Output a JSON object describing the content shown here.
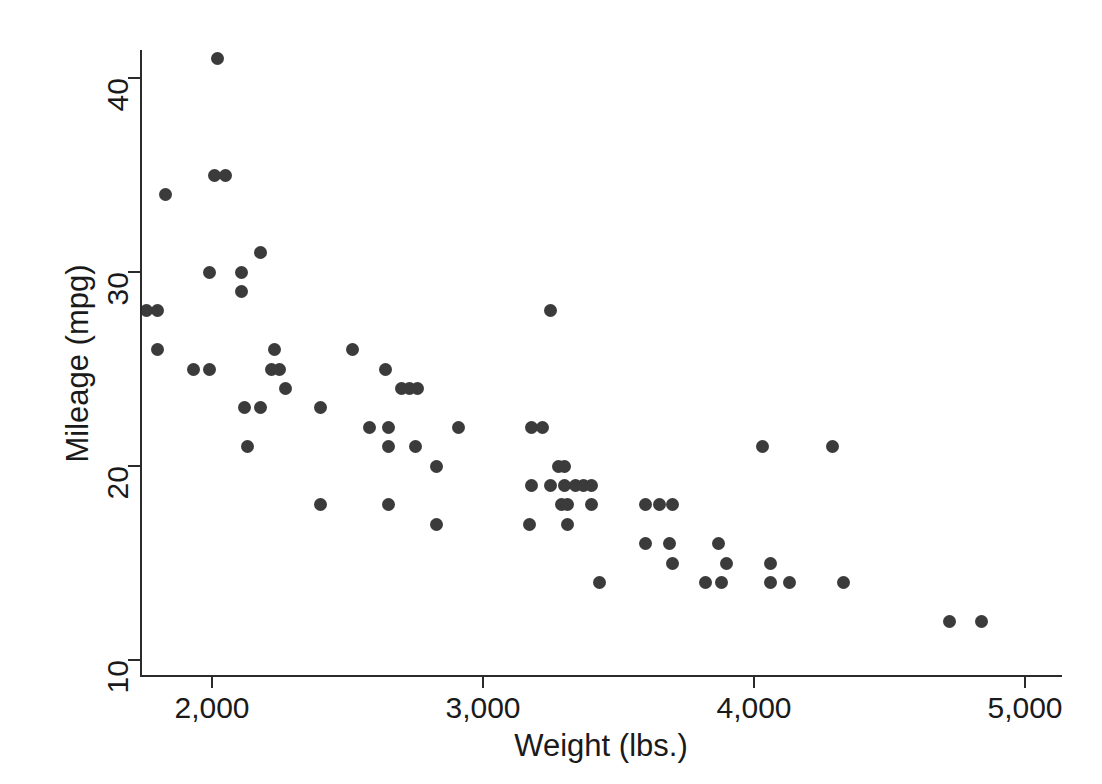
{
  "chart_data": {
    "type": "scatter",
    "title": "",
    "xlabel": "Weight (lbs.)",
    "ylabel": "Mileage (mpg)",
    "xlim": [
      1700,
      5050
    ],
    "ylim": [
      9.2,
      42.0
    ],
    "grid": false,
    "legend": "none",
    "marker": {
      "shape": "circle",
      "color": "#3b3b3b",
      "size_px": 13
    },
    "xticks": [
      2000,
      3000,
      4000,
      5000
    ],
    "xtick_labels": [
      "2,000",
      "3,000",
      "4,000",
      "5,000"
    ],
    "yticks": [
      10,
      20,
      30,
      40
    ],
    "ytick_labels": [
      "10",
      "20",
      "30",
      "40"
    ],
    "n_points": 74,
    "x": [
      1760,
      1800,
      1830,
      1800,
      2020,
      2020,
      2050,
      2040,
      1930,
      1990,
      2110,
      2160,
      2230,
      2110,
      2240,
      2230,
      2200,
      2230,
      2240,
      2070,
      2130,
      2240,
      2290,
      2370,
      2400,
      2520,
      2580,
      2650,
      2640,
      2670,
      2690,
      2700,
      2670,
      2650,
      2640,
      2750,
      2730,
      2800,
      2830,
      2830,
      2910,
      3180,
      3210,
      3250,
      3220,
      3280,
      3250,
      3260,
      3170,
      3170,
      3300,
      3330,
      3350,
      3370,
      3400,
      3380,
      3430,
      3420,
      3440,
      3470,
      3600,
      3600,
      3690,
      3700,
      3690,
      3720,
      3820,
      3850,
      3880,
      3900,
      4030,
      4060,
      4060,
      4080,
      4130,
      4290,
      4330,
      4720,
      4840
    ],
    "y": [
      28,
      28,
      34,
      26,
      41,
      35,
      35,
      30,
      25,
      25,
      30,
      31,
      26,
      29,
      25,
      25,
      23,
      24,
      24,
      21,
      23,
      25,
      24,
      23,
      18,
      26,
      22,
      22,
      25,
      24,
      24,
      24,
      21,
      21,
      18,
      22,
      21,
      20,
      17,
      17,
      22,
      17,
      22,
      28,
      22,
      20,
      20,
      19,
      19,
      19,
      19,
      18,
      19,
      19,
      19,
      18,
      14,
      17,
      18,
      18,
      18,
      16,
      18,
      18,
      16,
      15,
      18,
      14,
      14,
      16,
      21,
      15,
      14,
      14,
      14,
      21,
      14,
      12,
      12
    ],
    "points": [
      {
        "weight": 1760,
        "mpg": 28
      },
      {
        "weight": 1800,
        "mpg": 28
      },
      {
        "weight": 1830,
        "mpg": 34
      },
      {
        "weight": 1800,
        "mpg": 26
      },
      {
        "weight": 2020,
        "mpg": 41
      },
      {
        "weight": 2010,
        "mpg": 35
      },
      {
        "weight": 2050,
        "mpg": 35
      },
      {
        "weight": 1990,
        "mpg": 30
      },
      {
        "weight": 1930,
        "mpg": 25
      },
      {
        "weight": 1990,
        "mpg": 25
      },
      {
        "weight": 2110,
        "mpg": 30
      },
      {
        "weight": 2180,
        "mpg": 31
      },
      {
        "weight": 2230,
        "mpg": 26
      },
      {
        "weight": 2110,
        "mpg": 29
      },
      {
        "weight": 2220,
        "mpg": 25
      },
      {
        "weight": 2250,
        "mpg": 25
      },
      {
        "weight": 2120,
        "mpg": 23
      },
      {
        "weight": 2180,
        "mpg": 23
      },
      {
        "weight": 2270,
        "mpg": 24
      },
      {
        "weight": 2130,
        "mpg": 21
      },
      {
        "weight": 2400,
        "mpg": 23
      },
      {
        "weight": 2400,
        "mpg": 18
      },
      {
        "weight": 2520,
        "mpg": 26
      },
      {
        "weight": 2640,
        "mpg": 25
      },
      {
        "weight": 2580,
        "mpg": 22
      },
      {
        "weight": 2650,
        "mpg": 22
      },
      {
        "weight": 2700,
        "mpg": 24
      },
      {
        "weight": 2730,
        "mpg": 24
      },
      {
        "weight": 2760,
        "mpg": 24
      },
      {
        "weight": 2650,
        "mpg": 21
      },
      {
        "weight": 2750,
        "mpg": 21
      },
      {
        "weight": 2650,
        "mpg": 18
      },
      {
        "weight": 2830,
        "mpg": 20
      },
      {
        "weight": 2830,
        "mpg": 17
      },
      {
        "weight": 2910,
        "mpg": 22
      },
      {
        "weight": 3180,
        "mpg": 22
      },
      {
        "weight": 3220,
        "mpg": 22
      },
      {
        "weight": 3250,
        "mpg": 28
      },
      {
        "weight": 3280,
        "mpg": 20
      },
      {
        "weight": 3300,
        "mpg": 20
      },
      {
        "weight": 3180,
        "mpg": 19
      },
      {
        "weight": 3250,
        "mpg": 19
      },
      {
        "weight": 3300,
        "mpg": 19
      },
      {
        "weight": 3340,
        "mpg": 19
      },
      {
        "weight": 3370,
        "mpg": 19
      },
      {
        "weight": 3400,
        "mpg": 19
      },
      {
        "weight": 3290,
        "mpg": 18
      },
      {
        "weight": 3310,
        "mpg": 18
      },
      {
        "weight": 3400,
        "mpg": 18
      },
      {
        "weight": 3170,
        "mpg": 17
      },
      {
        "weight": 3310,
        "mpg": 17
      },
      {
        "weight": 3430,
        "mpg": 14
      },
      {
        "weight": 3600,
        "mpg": 18
      },
      {
        "weight": 3650,
        "mpg": 18
      },
      {
        "weight": 3700,
        "mpg": 18
      },
      {
        "weight": 3600,
        "mpg": 16
      },
      {
        "weight": 3690,
        "mpg": 16
      },
      {
        "weight": 3700,
        "mpg": 15
      },
      {
        "weight": 3820,
        "mpg": 14
      },
      {
        "weight": 3880,
        "mpg": 14
      },
      {
        "weight": 3870,
        "mpg": 16
      },
      {
        "weight": 3900,
        "mpg": 15
      },
      {
        "weight": 4030,
        "mpg": 21
      },
      {
        "weight": 4060,
        "mpg": 14
      },
      {
        "weight": 4130,
        "mpg": 14
      },
      {
        "weight": 4060,
        "mpg": 15
      },
      {
        "weight": 4290,
        "mpg": 21
      },
      {
        "weight": 4330,
        "mpg": 14
      },
      {
        "weight": 4720,
        "mpg": 12
      },
      {
        "weight": 4840,
        "mpg": 12
      }
    ]
  },
  "axes": {
    "x": {
      "title": "Weight (lbs.)",
      "ticks": [
        {
          "value": 2000,
          "label": "2,000"
        },
        {
          "value": 3000,
          "label": "3,000"
        },
        {
          "value": 4000,
          "label": "4,000"
        },
        {
          "value": 5000,
          "label": "5,000"
        }
      ]
    },
    "y": {
      "title": "Mileage (mpg)",
      "ticks": [
        {
          "value": 10,
          "label": "10"
        },
        {
          "value": 20,
          "label": "20"
        },
        {
          "value": 30,
          "label": "30"
        },
        {
          "value": 40,
          "label": "40"
        }
      ]
    }
  },
  "style": {
    "background": "#ffffff",
    "axis_color": "#2b2b2b",
    "text_color": "#1a1a1a",
    "marker_color": "#3b3b3b"
  }
}
